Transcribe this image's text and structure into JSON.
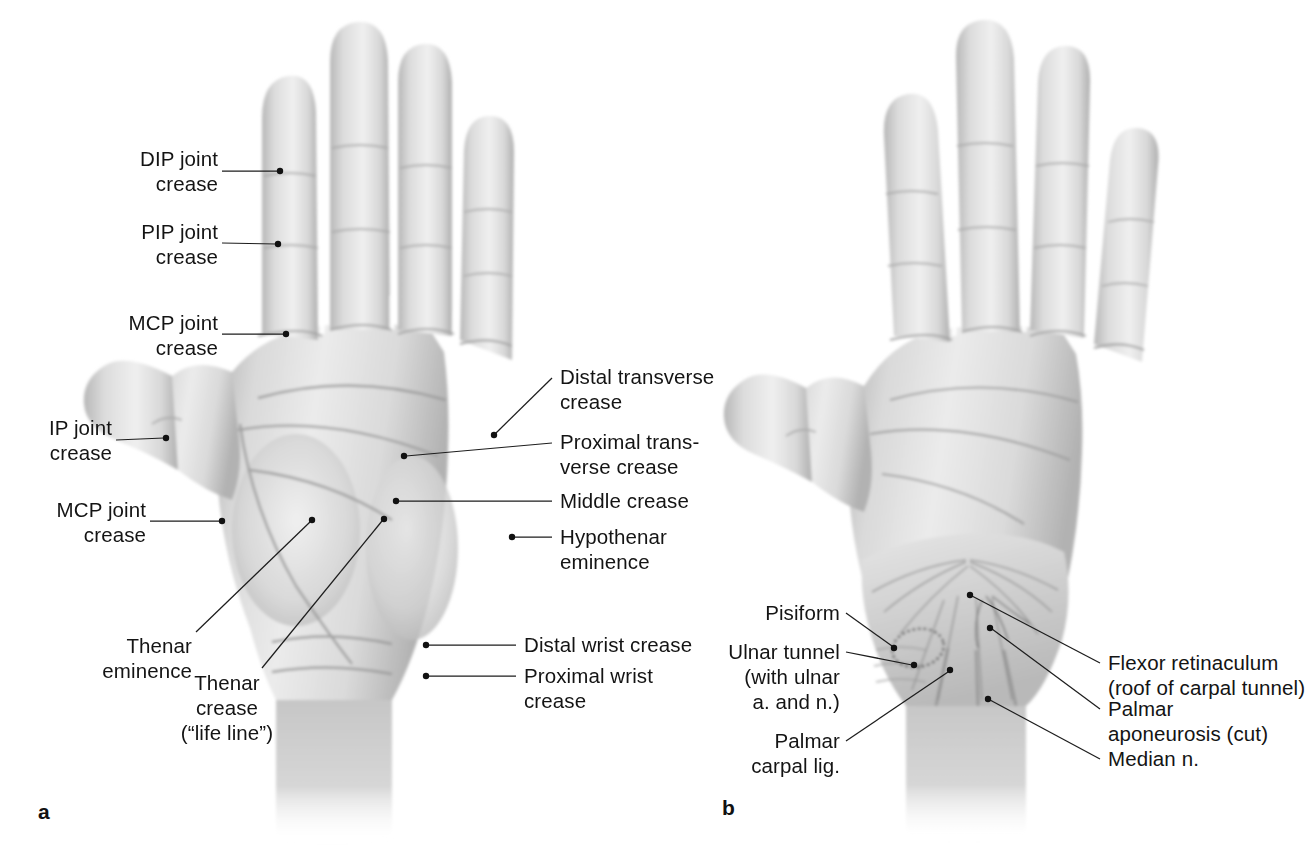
{
  "figure": {
    "type": "anatomical-illustration",
    "background_color": "#ffffff",
    "text_color": "#141414",
    "leader_line_color": "#1d1d1d",
    "panels": [
      {
        "letter": "a",
        "description": "Palm of the hand showing surface creases and eminences",
        "labels": [
          {
            "id": "dip-joint-crease",
            "text": "DIP joint\ncrease",
            "align": "right"
          },
          {
            "id": "pip-joint-crease",
            "text": "PIP joint\ncrease",
            "align": "right"
          },
          {
            "id": "mcp-joint-crease",
            "text": "MCP joint\ncrease",
            "align": "right"
          },
          {
            "id": "ip-joint-crease",
            "text": "IP joint\ncrease",
            "align": "right"
          },
          {
            "id": "mcp-joint-crease-thumb",
            "text": "MCP joint\ncrease",
            "align": "right"
          },
          {
            "id": "thenar-eminence",
            "text": "Thenar\neminence",
            "align": "right"
          },
          {
            "id": "thenar-crease",
            "text": "Thenar\ncrease\n(“life line”)",
            "align": "center"
          },
          {
            "id": "distal-transverse-crease",
            "text": "Distal transverse\ncrease",
            "align": "left"
          },
          {
            "id": "proximal-transverse-crease",
            "text": "Proximal trans-\nverse crease",
            "align": "left"
          },
          {
            "id": "middle-crease",
            "text": "Middle crease",
            "align": "left"
          },
          {
            "id": "hypothenar-eminence",
            "text": "Hypothenar\neminence",
            "align": "left"
          },
          {
            "id": "distal-wrist-crease",
            "text": "Distal wrist crease",
            "align": "left"
          },
          {
            "id": "proximal-wrist-crease",
            "text": "Proximal wrist\ncrease",
            "align": "left"
          }
        ]
      },
      {
        "letter": "b",
        "description": "Palm with superficial dissection of the wrist showing flexor retinaculum, palmar aponeurosis and ulnar tunnel",
        "labels": [
          {
            "id": "pisiform",
            "text": "Pisiform",
            "align": "right"
          },
          {
            "id": "ulnar-tunnel",
            "text": "Ulnar tunnel\n(with ulnar\na. and n.)",
            "align": "right"
          },
          {
            "id": "palmar-carpal-lig",
            "text": "Palmar\ncarpal lig.",
            "align": "right"
          },
          {
            "id": "flexor-retinaculum",
            "text": "Flexor retinaculum\n(roof of carpal tunnel)",
            "align": "left"
          },
          {
            "id": "palmar-aponeurosis",
            "text": "Palmar\naponeurosis (cut)",
            "align": "left"
          },
          {
            "id": "median-nerve",
            "text": "Median n.",
            "align": "left"
          }
        ]
      }
    ]
  }
}
